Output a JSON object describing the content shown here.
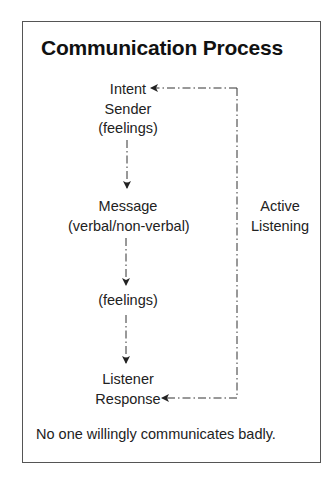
{
  "title": "Communication Process",
  "nodes": {
    "sender": {
      "line1": "Intent",
      "line2": "Sender",
      "line3": "(feelings)"
    },
    "message": {
      "line1": "Message",
      "line2": "(verbal/non-verbal)"
    },
    "feelings": {
      "line1": "(feelings)"
    },
    "listener": {
      "line1": "Listener",
      "line2": "Response"
    }
  },
  "feedback_loop": {
    "label_line1": "Active",
    "label_line2": "Listening"
  },
  "edges": [
    {
      "from": "sender",
      "to": "message",
      "style": "dash-dot",
      "arrow": "down"
    },
    {
      "from": "message",
      "to": "feelings",
      "style": "dash-dot",
      "arrow": "down"
    },
    {
      "from": "feelings",
      "to": "listener",
      "style": "dash-dot",
      "arrow": "down"
    },
    {
      "from": "listener",
      "to": "sender",
      "style": "dash-dot",
      "via": "right-side loop",
      "label": "Active Listening",
      "arrows": [
        "left-at-sender",
        "left-at-listener"
      ]
    }
  ],
  "footer": "No one willingly communicates badly.",
  "colors": {
    "text": "#222222",
    "line": "#333333",
    "frame": "#555555",
    "background": "#ffffff"
  }
}
